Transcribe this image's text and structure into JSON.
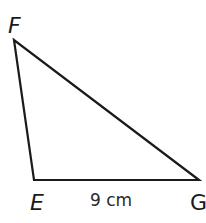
{
  "diagram": {
    "type": "triangle",
    "stroke_color": "#1a1a1a",
    "vertices": [
      {
        "name": "F",
        "x": 14,
        "y": 40
      },
      {
        "name": "E",
        "x": 34,
        "y": 180
      },
      {
        "name": "G",
        "x": 199,
        "y": 180
      }
    ],
    "labels": {
      "F": "F",
      "E": "E",
      "G": "G"
    },
    "side_labels": {
      "EG": "9 cm"
    }
  }
}
